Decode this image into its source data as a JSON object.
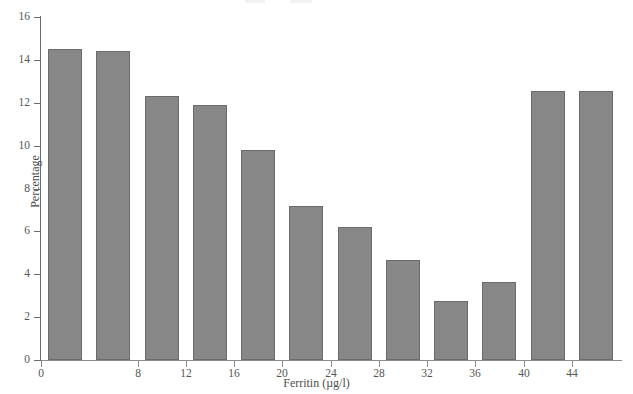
{
  "chart_data": {
    "type": "bar",
    "title": "",
    "xlabel": "Ferritin (µg/l)",
    "ylabel": "Percentage",
    "xlim": [
      0,
      48
    ],
    "ylim": [
      0,
      16
    ],
    "grid": false,
    "legend": null,
    "bar_color": "#878787",
    "bar_edge_color": "#6b6b6b",
    "axis_color": "#6e6e6e",
    "x_tick_values": [
      0,
      8,
      12,
      16,
      20,
      24,
      28,
      32,
      36,
      40,
      44
    ],
    "x_tick_labels": [
      "0",
      "8",
      "12",
      "16",
      "20",
      "24",
      "28",
      "32",
      "36",
      "40",
      "44"
    ],
    "y_tick_values": [
      0,
      2,
      4,
      6,
      8,
      10,
      12,
      14,
      16
    ],
    "y_tick_labels": [
      "0",
      "2",
      "4",
      "6",
      "8",
      "10",
      "12",
      "14",
      "16"
    ],
    "bin_width": 4,
    "bin_starts": [
      0,
      4,
      8,
      12,
      16,
      20,
      24,
      28,
      32,
      36,
      40,
      44
    ],
    "categories": [
      "0-4",
      "4-8",
      "8-12",
      "12-16",
      "16-20",
      "20-24",
      "24-28",
      "28-32",
      "32-36",
      "36-40",
      "40-44",
      "44-48"
    ],
    "values": [
      14.5,
      14.4,
      12.3,
      11.9,
      9.8,
      7.2,
      6.2,
      4.65,
      2.75,
      3.65,
      12.55,
      0
    ],
    "bars": [
      {
        "label": "0-4",
        "x_center": 2,
        "value": 14.5
      },
      {
        "label": "4-8",
        "x_center": 6,
        "value": 14.4
      },
      {
        "label": "8-12",
        "x_center": 10,
        "value": 12.3
      },
      {
        "label": "12-16",
        "x_center": 14,
        "value": 11.9
      },
      {
        "label": "16-20",
        "x_center": 18,
        "value": 9.8
      },
      {
        "label": "20-24",
        "x_center": 22,
        "value": 7.2
      },
      {
        "label": "24-28",
        "x_center": 26,
        "value": 6.2
      },
      {
        "label": "28-32",
        "x_center": 30,
        "value": 4.65
      },
      {
        "label": "32-36",
        "x_center": 34,
        "value": 2.75
      },
      {
        "label": "36-40",
        "x_center": 38,
        "value": 3.65
      },
      {
        "label": "40-44",
        "x_center": 42,
        "value": 12.55
      },
      {
        "label": "44-48",
        "x_center": 46,
        "value": 12.55
      }
    ]
  }
}
